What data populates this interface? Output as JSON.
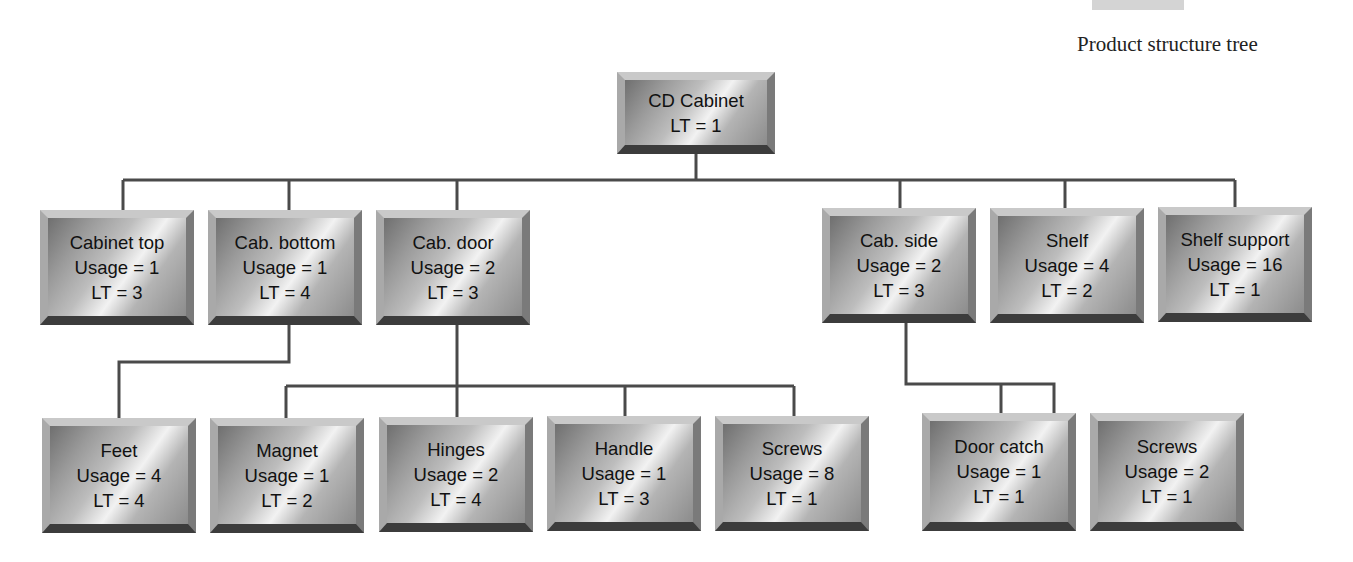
{
  "caption": "Product structure tree",
  "root": {
    "name": "CD Cabinet",
    "lt": "LT = 1"
  },
  "level1": [
    {
      "name": "Cabinet top",
      "usage": "Usage = 1",
      "lt": "LT = 3"
    },
    {
      "name": "Cab. bottom",
      "usage": "Usage = 1",
      "lt": "LT = 4"
    },
    {
      "name": "Cab. door",
      "usage": "Usage = 2",
      "lt": "LT = 3"
    },
    {
      "name": "Cab. side",
      "usage": "Usage = 2",
      "lt": "LT = 3"
    },
    {
      "name": "Shelf",
      "usage": "Usage = 4",
      "lt": "LT = 2"
    },
    {
      "name": "Shelf support",
      "usage": "Usage = 16",
      "lt": "LT = 1"
    }
  ],
  "level2": [
    {
      "name": "Feet",
      "usage": "Usage = 4",
      "lt": "LT = 4",
      "parent": "Cab. bottom"
    },
    {
      "name": "Magnet",
      "usage": "Usage = 1",
      "lt": "LT = 2",
      "parent": "Cab. door"
    },
    {
      "name": "Hinges",
      "usage": "Usage = 2",
      "lt": "LT = 4",
      "parent": "Cab. door"
    },
    {
      "name": "Handle",
      "usage": "Usage = 1",
      "lt": "LT = 3",
      "parent": "Cab. door"
    },
    {
      "name": "Screws",
      "usage": "Usage = 8",
      "lt": "LT = 1",
      "parent": "Cab. door"
    },
    {
      "name": "Door catch",
      "usage": "Usage = 1",
      "lt": "LT = 1",
      "parent": "Cab. side"
    },
    {
      "name": "Screws",
      "usage": "Usage = 2",
      "lt": "LT = 1",
      "parent": "Cab. side"
    }
  ],
  "colors": {
    "line": "#4a4a4a",
    "box_light": "#f2f2f2",
    "box_dark": "#3c3c3c"
  }
}
